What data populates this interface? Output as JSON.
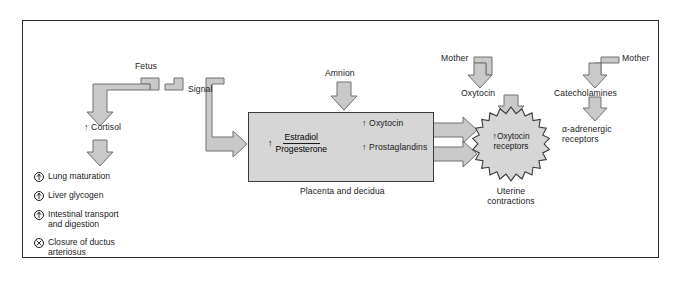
{
  "diagram": {
    "background_color": "#ffffff",
    "frame_color": "#2b2b2b",
    "box_fill": "#d6d6d6",
    "arrow_fill": "#c9c9c9",
    "arrow_stroke": "#6e6e6e",
    "text_color": "#1a1a1a"
  },
  "fetal_branch": {
    "source_label": "Fetus",
    "signal_label": "Signal",
    "cortisol_label": "Cortisol",
    "cortisol_arrow": "up-arrow",
    "outcomes": [
      {
        "symbol": "up-arrow-circle",
        "text": "Lung maturation"
      },
      {
        "symbol": "up-arrow-circle",
        "text": "Liver glycogen"
      },
      {
        "symbol": "up-arrow-circle",
        "text": "Intestinal transport and digestion"
      },
      {
        "symbol": "x-circle",
        "text": "Closure of ductus arteriosus"
      }
    ]
  },
  "amnion": {
    "label": "Amnion"
  },
  "placenta": {
    "caption": "Placenta and decidua",
    "numerator": "Estradiol",
    "denominator": "Progesterone",
    "ratio_arrow": "up-arrow",
    "outputs": [
      {
        "arrow": "up-arrow",
        "label": "Oxytocin"
      },
      {
        "arrow": "up-arrow",
        "label": "Prostaglandins"
      }
    ]
  },
  "maternal_oxytocin": {
    "source_label": "Mother",
    "hormone_label": "Oxytocin"
  },
  "maternal_catecholamines": {
    "source_label": "Mother",
    "hormone_label": "Catecholamines",
    "receptor_label_line1": "α-adrenergic",
    "receptor_label_line2": "receptors"
  },
  "uterus": {
    "receptor_arrow": "up-arrow",
    "receptor_line1": "Oxytocin",
    "receptor_line2": "receptors",
    "caption_line1": "Uterine",
    "caption_line2": "contractions"
  },
  "glyphs": {
    "up_arrow": "↑"
  }
}
